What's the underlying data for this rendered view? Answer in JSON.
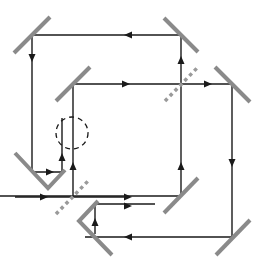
{
  "figure": {
    "colors": {
      "beam": "#1a1a1a",
      "mirror": "#8a8a8a",
      "beam_splitter": "#9a9a9a",
      "background": "#ffffff"
    },
    "components": {
      "mirrors": [
        {
          "id": "mirror-top-left",
          "x1": 14,
          "y1": 53,
          "x2": 50,
          "y2": 17
        },
        {
          "id": "mirror-top-right",
          "x1": 164,
          "y1": 18,
          "x2": 198,
          "y2": 52
        },
        {
          "id": "mirror-inner-left",
          "x1": 56,
          "y1": 101,
          "x2": 90,
          "y2": 67
        },
        {
          "id": "mirror-right",
          "x1": 215,
          "y1": 67,
          "x2": 250,
          "y2": 102
        },
        {
          "id": "mirror-bottom-right",
          "x1": 164,
          "y1": 213,
          "x2": 198,
          "y2": 178
        },
        {
          "id": "mirror-bottom-far-right",
          "x1": 216,
          "y1": 255,
          "x2": 250,
          "y2": 220
        }
      ],
      "corner_reflectors": [
        {
          "id": "corner-left",
          "points": "15,153 48,188 65,170"
        },
        {
          "id": "corner-bottom",
          "points": "98,201 79,221 112,255"
        }
      ],
      "beam_splitters": [
        {
          "id": "splitter-upper",
          "x1": 165,
          "y1": 101,
          "x2": 198,
          "y2": 67
        },
        {
          "id": "splitter-lower",
          "x1": 56,
          "y1": 214,
          "x2": 89,
          "y2": 180
        }
      ],
      "interaction_region": {
        "id": "dashed-circle",
        "cx": 72,
        "cy": 133,
        "r": 16
      }
    },
    "beams": [
      {
        "id": "beam-top",
        "points": "32,35 181,35"
      },
      {
        "id": "beam-left-down",
        "points": "32,35 32,172 62,172 62,118"
      },
      {
        "id": "beam-input",
        "points": "15,197 129,197"
      },
      {
        "id": "beam-center-up",
        "points": "73,197 73,84 232,84 232,237 85,237"
      },
      {
        "id": "beam-bottom-return",
        "points": "95,203 95,234"
      },
      {
        "id": "beam-bottom-out",
        "points": "95,204 155,204"
      },
      {
        "id": "beam-right-up",
        "points": "181,196 181,35"
      },
      {
        "id": "beam-bottom-left",
        "points": "0,196 181,196"
      }
    ],
    "arrows": [
      {
        "id": "arrow-top-left",
        "x": 128,
        "y": 35,
        "dir": "left"
      },
      {
        "id": "arrow-left-down",
        "x": 32,
        "y": 58,
        "dir": "down"
      },
      {
        "id": "arrow-inner-right",
        "x": 126,
        "y": 84,
        "dir": "right"
      },
      {
        "id": "arrow-splitter-up",
        "x": 181,
        "y": 60,
        "dir": "up"
      },
      {
        "id": "arrow-splitter-right",
        "x": 208,
        "y": 84,
        "dir": "right"
      },
      {
        "id": "arrow-right-down",
        "x": 232,
        "y": 163,
        "dir": "down"
      },
      {
        "id": "arrow-right-up",
        "x": 181,
        "y": 166,
        "dir": "up"
      },
      {
        "id": "arrow-corner-left-right",
        "x": 50,
        "y": 172,
        "dir": "right"
      },
      {
        "id": "arrow-corner-left-up",
        "x": 62,
        "y": 157,
        "dir": "up"
      },
      {
        "id": "arrow-center-up",
        "x": 73,
        "y": 166,
        "dir": "up"
      },
      {
        "id": "arrow-input-right",
        "x": 44,
        "y": 197,
        "dir": "right"
      },
      {
        "id": "arrow-output-right",
        "x": 128,
        "y": 197,
        "dir": "right"
      },
      {
        "id": "arrow-bottom-out-right",
        "x": 128,
        "y": 206,
        "dir": "right"
      },
      {
        "id": "arrow-bottom-up",
        "x": 95,
        "y": 222,
        "dir": "up"
      },
      {
        "id": "arrow-bottom-left",
        "x": 128,
        "y": 237,
        "dir": "left"
      }
    ]
  }
}
